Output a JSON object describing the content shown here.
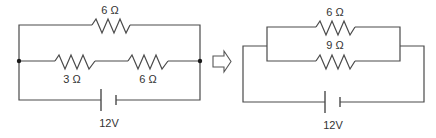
{
  "diagram": {
    "type": "circuit-simplification",
    "colors": {
      "wire": "#4a4a4a",
      "label": "#333333",
      "junction": "#1a1a1a"
    },
    "original_circuit": {
      "top_branch": {
        "resistor_label": "6 Ω"
      },
      "middle_branch": {
        "resistors": [
          {
            "label": "3 Ω"
          },
          {
            "label": "6 Ω"
          }
        ]
      },
      "battery": {
        "label": "12V"
      }
    },
    "transform_arrow": {
      "icon": "right-hollow-arrow-icon"
    },
    "simplified_circuit": {
      "parallel_resistors": [
        {
          "label": "6 Ω"
        },
        {
          "label": "9 Ω"
        }
      ],
      "battery": {
        "label": "12V"
      }
    }
  }
}
